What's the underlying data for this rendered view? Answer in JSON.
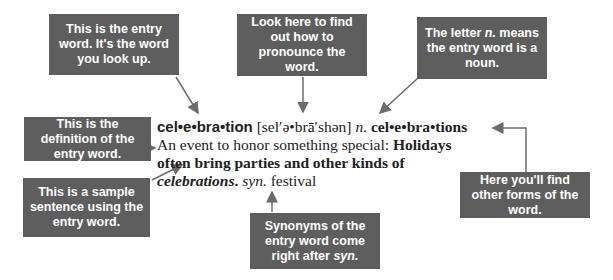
{
  "entry": {
    "headword": "cel•e•bra•tion",
    "pronunciation": "[sel′ə•brā′shən]",
    "part_of_speech": "n.",
    "plural_form": "cel•e•bra•tions",
    "definition": "An event to honor something special:",
    "sample_sentence_bold": "Holidays often bring parties and other kinds of",
    "sample_sentence_italic": "celebrations",
    "sample_period": ".",
    "syn_label": "syn.",
    "synonym": "festival"
  },
  "callouts": {
    "entry_word": "This is the entry word. It's the word you look up.",
    "pronunciation": "Look here to find out how to pronounce the word.",
    "noun_pre": "The letter ",
    "noun_em": "n.",
    "noun_post": " means the entry word is a noun.",
    "definition": "This is the definition of the entry word.",
    "sample": "This is a sample sentence using the entry word.",
    "synonym_pre": "Synonyms of the entry word come right after ",
    "synonym_em": "syn.",
    "other_forms": "Here you'll find other forms of the word."
  },
  "colors": {
    "box": "#5e5e5e",
    "arrow": "#6b6b6b",
    "text": "#222222"
  }
}
